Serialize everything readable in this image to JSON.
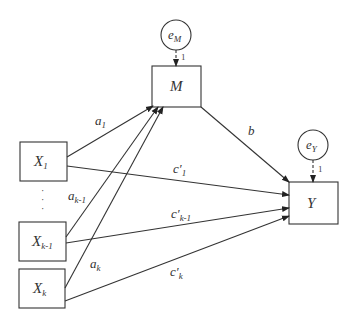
{
  "diagram": {
    "type": "mediation-path-diagram",
    "nodes": {
      "M": {
        "label": "M",
        "sub": ""
      },
      "Y": {
        "label": "Y",
        "sub": ""
      },
      "X1": {
        "label": "X",
        "sub": "1"
      },
      "Xk1": {
        "label": "X",
        "sub": "k-1"
      },
      "Xk": {
        "label": "X",
        "sub": "k"
      },
      "eM": {
        "label": "e",
        "sub": "M"
      },
      "eY": {
        "label": "e",
        "sub": "Y"
      }
    },
    "error_loadings": {
      "eM": "1",
      "eY": "1"
    },
    "paths": {
      "a1": {
        "label": "a",
        "sub": "1"
      },
      "ak1": {
        "label": "a",
        "sub": "k-1"
      },
      "ak": {
        "label": "a",
        "sub": "k"
      },
      "b": {
        "label": "b",
        "sub": ""
      },
      "c1": {
        "label": "c′",
        "sub": "1"
      },
      "ck1": {
        "label": "c′",
        "sub": "k-1"
      },
      "ck": {
        "label": "c′",
        "sub": "k"
      }
    },
    "ellipsis": "·\n·\n·"
  }
}
